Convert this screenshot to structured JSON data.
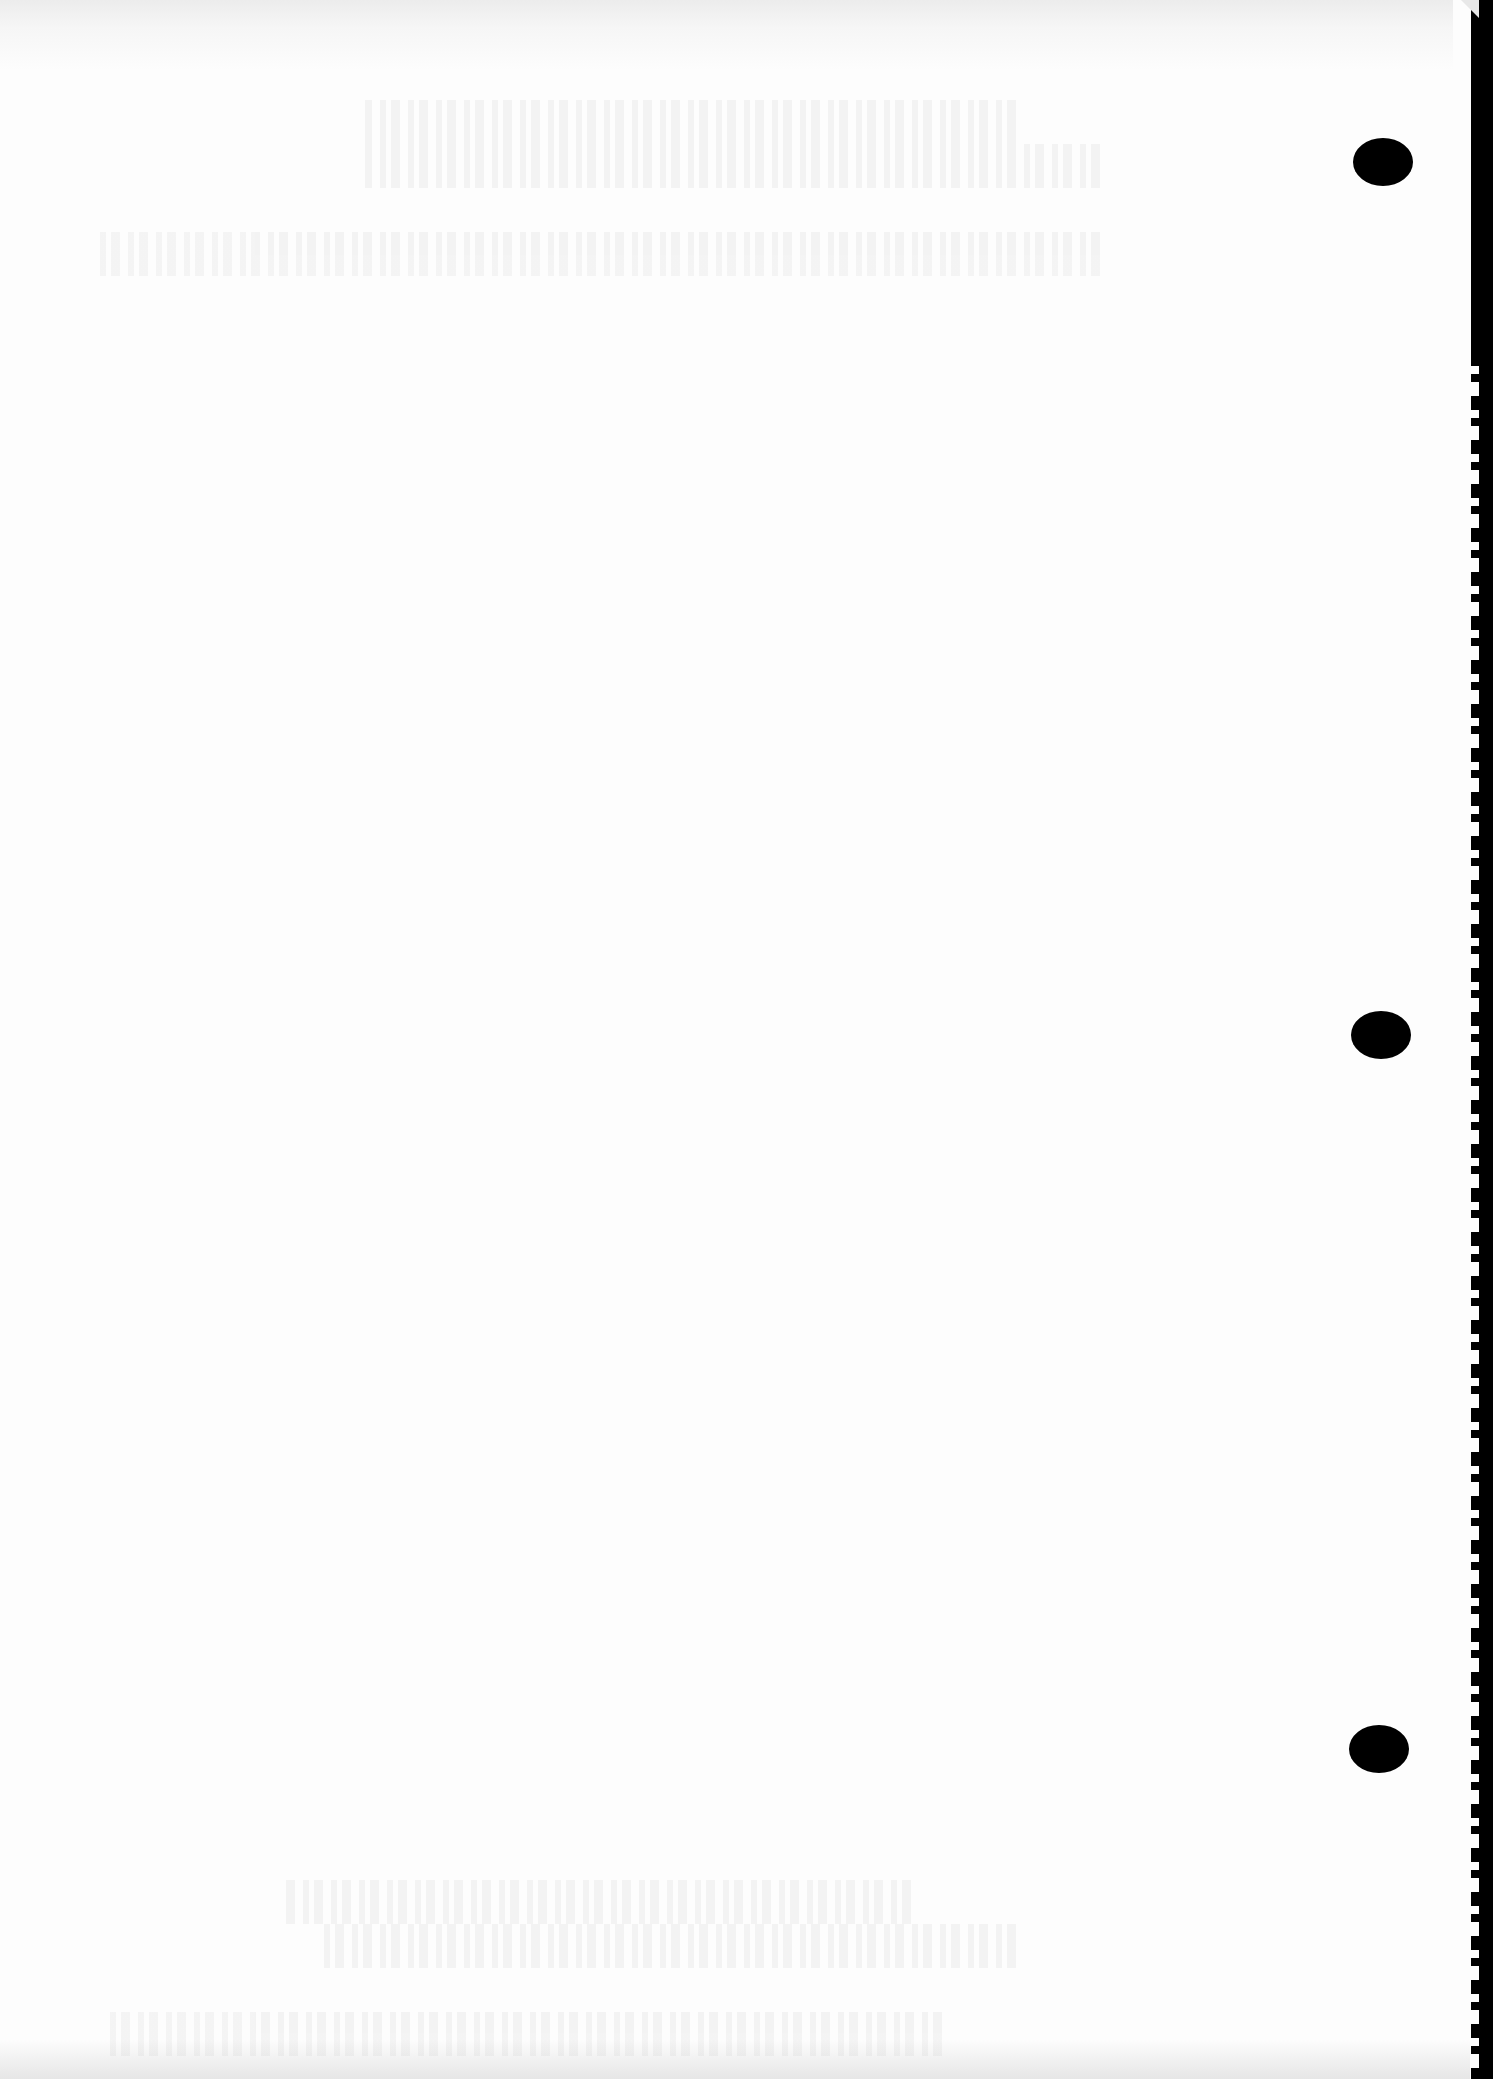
{
  "document": {
    "type": "scanned-blank-page",
    "content_text": "",
    "background_color": "#fdfdfd",
    "border_color": "#000000",
    "punch_holes": [
      {
        "id": "top",
        "x": 1383,
        "y": 162
      },
      {
        "id": "middle",
        "x": 1381,
        "y": 1035
      },
      {
        "id": "bottom",
        "x": 1379,
        "y": 1749
      }
    ]
  }
}
